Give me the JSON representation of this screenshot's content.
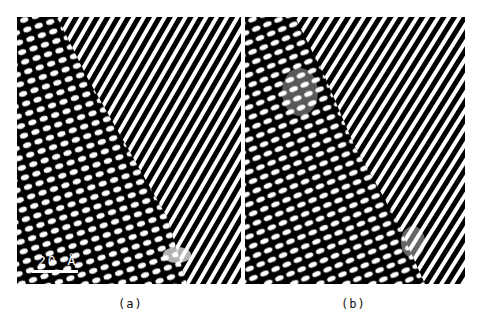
{
  "figure": {
    "panels": [
      {
        "id": "a",
        "caption": "(a)",
        "description": "High-resolution lattice image showing a boundary between a region of elongated dot lattice (lower left) and diagonal fringe lattice (upper right)"
      },
      {
        "id": "b",
        "caption": "(b)",
        "description": "High-resolution lattice image with elongated dot lattice on the left and diagonal fringes on the right separated by a diffuse boundary"
      }
    ],
    "scale_bar": {
      "label": "20 Å"
    },
    "colors": {
      "background": "#ffffff",
      "image_dark": "#000000",
      "image_light": "#ffffff"
    }
  }
}
